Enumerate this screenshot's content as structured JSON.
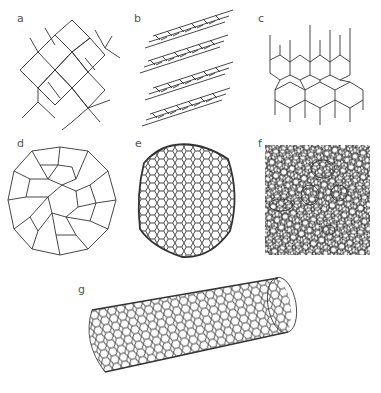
{
  "figure": {
    "panels": [
      {
        "id": "a",
        "label": "a",
        "description": "diamond lattice"
      },
      {
        "id": "b",
        "label": "b",
        "description": "graphite layers"
      },
      {
        "id": "c",
        "label": "c",
        "description": "lonsdaleite lattice"
      },
      {
        "id": "d",
        "label": "d",
        "description": "C60 buckminsterfullerene"
      },
      {
        "id": "e",
        "label": "e",
        "description": "C540 fullerene"
      },
      {
        "id": "f",
        "label": "f",
        "description": "amorphous carbon"
      },
      {
        "id": "g",
        "label": "g",
        "description": "single-walled carbon nanotube"
      }
    ],
    "colors": {
      "line": "#333333",
      "label": "#555555",
      "background": "#ffffff"
    }
  }
}
